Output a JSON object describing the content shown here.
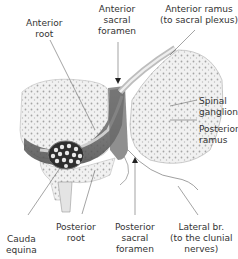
{
  "diagram": {
    "type": "anatomical-cross-section",
    "labels": {
      "anterior_root": "Anterior\nroot",
      "anterior_sacral_foramen": "Anterior\nsacral\nforamen",
      "anterior_ramus": "Anterior ramus\n(to sacral plexus)",
      "spinal_ganglion": "Spinal\nganglion",
      "posterior_ramus": "Posterior\nramus",
      "cauda_equina": "Cauda\nequina",
      "posterior_root": "Posterior\nroot",
      "posterior_sacral_foramen": "Posterior\nsacral\nforamen",
      "lateral_branch": "Lateral br.\n(to the clunial\nnerves)"
    },
    "colors": {
      "bone_fill": "#ececec",
      "bone_texture": "#9a9a9a",
      "canal_dark": "#555555",
      "nerve_light": "#d8d8d8",
      "leader_line": "#666666",
      "text": "#333333"
    }
  }
}
